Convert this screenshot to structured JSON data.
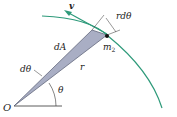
{
  "diagram": {
    "labels": {
      "velocity": "v",
      "arc_length": "rdθ",
      "area_element": "dA",
      "mass": "m",
      "mass_subscript": "2",
      "radius": "r",
      "d_theta": "dθ",
      "theta": "θ",
      "origin": "O"
    },
    "colors": {
      "orbit": "#2e9a7a",
      "wedge_fill": "#a9aec4",
      "wedge_stroke": "#555a70",
      "text": "#222222"
    }
  }
}
